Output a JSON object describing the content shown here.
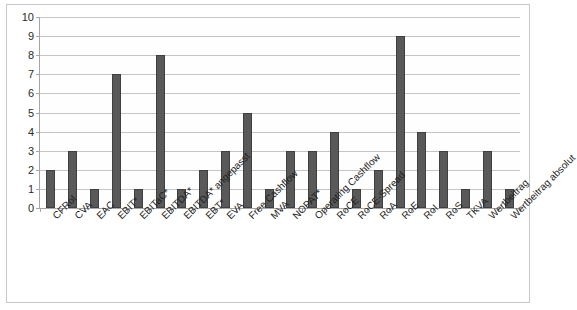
{
  "chart_data": {
    "type": "bar",
    "title": "",
    "xlabel": "",
    "ylabel": "",
    "ylim": [
      0,
      10
    ],
    "ytick_values": [
      10,
      9,
      8,
      7,
      6,
      5,
      4,
      3,
      2,
      1,
      0
    ],
    "ytick_labels": [
      "10",
      "9",
      "8",
      "7",
      "6",
      "5",
      "4",
      "3",
      "2",
      "1",
      "0"
    ],
    "grid": true,
    "legend": false,
    "bar_color": "#595959",
    "bar_border_color": "#3f3f3f",
    "gridline_color": "#c4c4c4",
    "axis_color": "#a6a6a6",
    "categories": [
      "CFRoI",
      "CVA",
      "EAC",
      "EBIT*",
      "EBITaC*",
      "EBITDA*",
      "EBITDA* angepasst",
      "EBT*",
      "EVA",
      "Free Cashflow",
      "MVA",
      "NOPAT*",
      "Operating Cashflow",
      "RoCE",
      "RoCE-Spread",
      "RoA",
      "RoE",
      "RoI",
      "RoS",
      "TKVA",
      "Wertbeitrag",
      "Wertbeitrag absolut"
    ],
    "values": [
      2,
      3,
      1,
      7,
      1,
      8,
      1,
      2,
      3,
      5,
      1,
      3,
      3,
      4,
      1,
      2,
      9,
      4,
      3,
      1,
      3,
      1
    ]
  }
}
